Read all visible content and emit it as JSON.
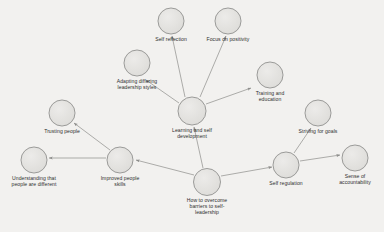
{
  "diagram": {
    "background_color": "#f2f1ef",
    "node_fill_color": "#e3e2df",
    "node_stroke_color": "#9a9a98",
    "edge_color": "#8c8c8a",
    "text_color": "#2e2e2e",
    "nodes": [
      {
        "id": "self-reflection",
        "label": "Self reflection",
        "lines": [
          "Self reflection"
        ],
        "cx": 171,
        "cy": 20.5,
        "r": 13.5,
        "label_offset": 15
      },
      {
        "id": "focus-on-positivity",
        "label": "Focus on positivity",
        "lines": [
          "Focus on positivity"
        ],
        "cx": 228,
        "cy": 20.5,
        "r": 13.5,
        "label_offset": 15
      },
      {
        "id": "adapting-differing-leadership-styles",
        "label": "Adapting differing leadership styles",
        "lines": [
          "Adapting differing",
          "leadership styles"
        ],
        "cx": 137,
        "cy": 63,
        "r": 13.5,
        "label_offset": 15
      },
      {
        "id": "training-and-education",
        "label": "Training and education",
        "lines": [
          "Training and",
          "education"
        ],
        "cx": 270,
        "cy": 75,
        "r": 13.5,
        "label_offset": 15
      },
      {
        "id": "learning-and-self-development",
        "label": "Learning and self development",
        "lines": [
          "Learning and self",
          "development"
        ],
        "cx": 192,
        "cy": 110.5,
        "r": 14.5,
        "label_offset": 16
      },
      {
        "id": "trusting-people",
        "label": "Trusting people",
        "lines": [
          "Trusting people"
        ],
        "cx": 62,
        "cy": 113,
        "r": 13.5,
        "label_offset": 15
      },
      {
        "id": "striving-for-goals",
        "label": "Striving for goals",
        "lines": [
          "Striving for goals"
        ],
        "cx": 318,
        "cy": 113,
        "r": 13.5,
        "label_offset": 15
      },
      {
        "id": "understanding-that-people-are-different",
        "label": "Understanding that people are different",
        "lines": [
          "Understanding that",
          "people are different"
        ],
        "cx": 34,
        "cy": 160,
        "r": 13.5,
        "label_offset": 15
      },
      {
        "id": "improved-people-skills",
        "label": "Improved people skills",
        "lines": [
          "Improved people",
          "skills"
        ],
        "cx": 120,
        "cy": 160,
        "r": 13.5,
        "label_offset": 15
      },
      {
        "id": "how-to-overcome-barriers-to-self-leadership",
        "label": "How to overcome barriers to self-leadership",
        "lines": [
          "How to overcome",
          "barriers to self-",
          "leadership"
        ],
        "cx": 207,
        "cy": 182,
        "r": 14,
        "label_offset": 15
      },
      {
        "id": "self-regulation",
        "label": "Self regulation",
        "lines": [
          "Self regulation"
        ],
        "cx": 286,
        "cy": 165,
        "r": 13.5,
        "label_offset": 15
      },
      {
        "id": "sense-of-accountability",
        "label": "Sense of accountability",
        "lines": [
          "Sense of",
          "accountability"
        ],
        "cx": 355,
        "cy": 158,
        "r": 13.5,
        "label_offset": 15
      }
    ],
    "edges": [
      {
        "id": "edge-learning-to-self-reflection",
        "from": "learning-and-self-development",
        "to": "self-reflection",
        "x1": 185,
        "y1": 97,
        "x2": 172,
        "y2": 36
      },
      {
        "id": "edge-learning-to-focus-on-positivity",
        "from": "learning-and-self-development",
        "to": "focus-on-positivity",
        "x1": 200,
        "y1": 97,
        "x2": 226,
        "y2": 36
      },
      {
        "id": "edge-learning-to-adapting-styles",
        "from": "learning-and-self-development",
        "to": "adapting-differing-leadership-styles",
        "x1": 179,
        "y1": 103,
        "x2": 146,
        "y2": 80
      },
      {
        "id": "edge-learning-to-training",
        "from": "learning-and-self-development",
        "to": "training-and-education",
        "x1": 206,
        "y1": 104,
        "x2": 251,
        "y2": 88
      },
      {
        "id": "edge-barriers-to-learning",
        "from": "how-to-overcome-barriers-to-self-leadership",
        "to": "learning-and-self-development",
        "x1": 203,
        "y1": 168,
        "x2": 194,
        "y2": 127
      },
      {
        "id": "edge-barriers-to-improved-people-skills",
        "from": "how-to-overcome-barriers-to-self-leadership",
        "to": "improved-people-skills",
        "x1": 194,
        "y1": 175,
        "x2": 136,
        "y2": 160
      },
      {
        "id": "edge-barriers-to-self-regulation",
        "from": "how-to-overcome-barriers-to-self-leadership",
        "to": "self-regulation",
        "x1": 221,
        "y1": 176,
        "x2": 272,
        "y2": 167
      },
      {
        "id": "edge-improved-skills-to-trusting-people",
        "from": "improved-people-skills",
        "to": "trusting-people",
        "x1": 110,
        "y1": 150,
        "x2": 74,
        "y2": 123
      },
      {
        "id": "edge-improved-skills-to-understanding",
        "from": "improved-people-skills",
        "to": "understanding-that-people-are-different",
        "x1": 106,
        "y1": 158,
        "x2": 49,
        "y2": 158
      },
      {
        "id": "edge-self-regulation-to-striving-for-goals",
        "from": "self-regulation",
        "to": "striving-for-goals",
        "x1": 294,
        "y1": 153,
        "x2": 311,
        "y2": 128
      },
      {
        "id": "edge-self-regulation-to-sense-of-accountability",
        "from": "self-regulation",
        "to": "sense-of-accountability",
        "x1": 300,
        "y1": 161,
        "x2": 340,
        "y2": 155
      }
    ]
  }
}
